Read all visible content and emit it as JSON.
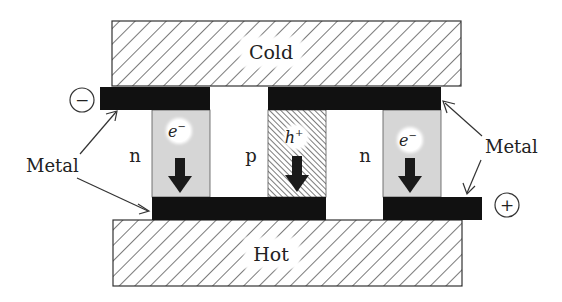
{
  "diagram": {
    "plates": {
      "top": {
        "label": "Cold"
      },
      "bottom": {
        "label": "Hot"
      }
    },
    "terminals": {
      "negative": "−",
      "positive": "+"
    },
    "legs": [
      {
        "type_label": "n",
        "carrier": "e",
        "carrier_sup": "−",
        "fill": "#d6d6d6"
      },
      {
        "type_label": "p",
        "carrier": "h",
        "carrier_sup": "+",
        "fill": "hatch"
      },
      {
        "type_label": "n",
        "carrier": "e",
        "carrier_sup": "−",
        "fill": "#d6d6d6"
      }
    ],
    "metal_labels": {
      "left": "Metal",
      "right": "Metal"
    },
    "colors": {
      "metal": "#111111",
      "n_leg": "#d6d6d6",
      "plate_hatch": "#333333",
      "arrow": "#1a1a1a"
    }
  }
}
